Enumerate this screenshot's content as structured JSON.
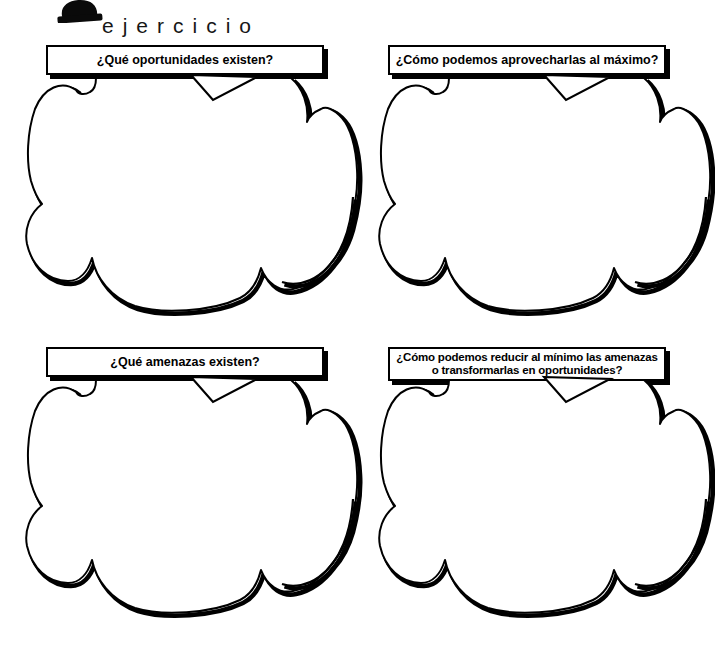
{
  "page": {
    "kind": "exercise-worksheet",
    "language": "es",
    "colors": {
      "ink": "#000000",
      "paper": "#ffffff"
    }
  },
  "header": {
    "icon": "exercise-stamp-icon",
    "title": "ejercicio"
  },
  "quadrants": [
    {
      "id": "opportunities",
      "question": "¿Qué oportunidades existen?"
    },
    {
      "id": "maximize-opportunities",
      "question": "¿Cómo podemos aprovecharlas al máximo?"
    },
    {
      "id": "threats",
      "question": "¿Qué amenazas existen?"
    },
    {
      "id": "minimize-threats",
      "question": "¿Cómo podemos reducir al mínimo las amenazas o transformarlas en oportunidades?"
    }
  ],
  "answer_area": {
    "label": "empty thought cloud for writing answers",
    "value": ""
  }
}
